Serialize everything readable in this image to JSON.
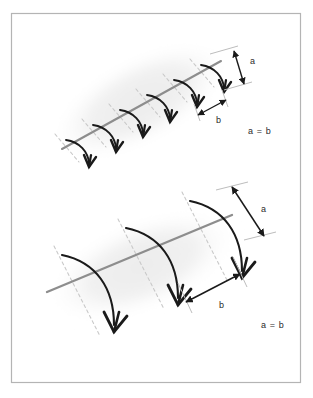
{
  "figure": {
    "background_color": "#ffffff",
    "border_color": "#b4b4b4",
    "frame": {
      "x": 11,
      "y": 13,
      "width": 290,
      "height": 370
    }
  },
  "colors": {
    "axis_line": "#8d8d8d",
    "tick_line": "#c9c9c9",
    "arrow_stroke": "#1a1a1a",
    "dimension_stroke": "#1a1a1a",
    "extension_line": "#bdbdbd",
    "blob_shadow": "#f1f1f1",
    "label_text": "#2b2b2b",
    "paper": "#ffffff"
  },
  "panels": [
    {
      "id": "top-panel",
      "name": "dense-short-arrows-panel",
      "description": "Elongated shaded blob with a gray central axis crossed by six small closely spaced curved arrows",
      "arrow_count": 6,
      "axis": {
        "x1": 62,
        "y1": 149,
        "x2": 221,
        "y2": 61
      },
      "blob": {
        "cx": 140,
        "cy": 101,
        "rx": 104,
        "ry": 47,
        "rotate": -28
      },
      "labels": {
        "a": "a",
        "b": "b",
        "relation": "a = b"
      },
      "label_positions": {
        "a": {
          "x": 247,
          "y": 64
        },
        "b": {
          "x": 219,
          "y": 119
        },
        "relation": {
          "x": 249,
          "y": 133
        }
      },
      "dimension_a": {
        "x1": 222,
        "y1": 52,
        "x2": 238,
        "y2": 81
      },
      "dimension_b": {
        "x1": 198,
        "y1": 113,
        "x2": 228,
        "y2": 97
      }
    },
    {
      "id": "bottom-panel",
      "name": "sparse-long-arrows-panel",
      "description": "Elongated shaded blob with a gray central axis crossed by three large widely spaced curved arrows",
      "arrow_count": 3,
      "axis": {
        "x1": 47,
        "y1": 292,
        "x2": 232,
        "y2": 215
      },
      "blob": {
        "cx": 142,
        "cy": 264,
        "rx": 106,
        "ry": 48,
        "rotate": -22
      },
      "labels": {
        "a": "a",
        "b": "b",
        "relation": "a = b"
      },
      "label_positions": {
        "a": {
          "x": 258,
          "y": 211
        },
        "b": {
          "x": 222,
          "y": 303
        },
        "relation": {
          "x": 262,
          "y": 327
        }
      },
      "dimension_a": {
        "x1": 231,
        "y1": 186,
        "x2": 262,
        "y2": 235
      },
      "dimension_b": {
        "x1": 185,
        "y1": 300,
        "x2": 240,
        "y2": 272
      }
    }
  ],
  "top_arrows": [
    {
      "start": [
        66,
        140
      ],
      "c1": [
        80,
        142
      ],
      "c2": [
        88,
        152
      ],
      "end": [
        89,
        166
      ]
    },
    {
      "start": [
        93,
        125
      ],
      "c1": [
        107,
        127
      ],
      "c2": [
        115,
        137
      ],
      "end": [
        116,
        151
      ]
    },
    {
      "start": [
        120,
        110
      ],
      "c1": [
        134,
        112
      ],
      "c2": [
        142,
        122
      ],
      "end": [
        143,
        136
      ]
    },
    {
      "start": [
        147,
        95
      ],
      "c1": [
        161,
        97
      ],
      "c2": [
        169,
        107
      ],
      "end": [
        170,
        121
      ]
    },
    {
      "start": [
        174,
        80
      ],
      "c1": [
        188,
        82
      ],
      "c2": [
        196,
        92
      ],
      "end": [
        197,
        106
      ]
    },
    {
      "start": [
        201,
        65
      ],
      "c1": [
        215,
        67
      ],
      "c2": [
        223,
        77
      ],
      "end": [
        224,
        91
      ]
    }
  ],
  "top_ticks": [
    {
      "x1": 55,
      "y1": 134,
      "x2": 79,
      "y2": 162
    },
    {
      "x1": 82,
      "y1": 119,
      "x2": 106,
      "y2": 147
    },
    {
      "x1": 109,
      "y1": 104,
      "x2": 133,
      "y2": 132
    },
    {
      "x1": 136,
      "y1": 89,
      "x2": 160,
      "y2": 117
    },
    {
      "x1": 163,
      "y1": 74,
      "x2": 187,
      "y2": 102
    },
    {
      "x1": 190,
      "y1": 59,
      "x2": 214,
      "y2": 87
    }
  ],
  "bottom_arrows": [
    {
      "start": [
        62,
        255
      ],
      "c1": [
        96,
        262
      ],
      "c2": [
        116,
        290
      ],
      "end": [
        115,
        330
      ]
    },
    {
      "start": [
        126,
        228
      ],
      "c1": [
        160,
        235
      ],
      "c2": [
        180,
        263
      ],
      "end": [
        179,
        303
      ]
    },
    {
      "start": [
        190,
        201
      ],
      "c1": [
        224,
        208
      ],
      "c2": [
        244,
        236
      ],
      "end": [
        243,
        276
      ]
    }
  ],
  "bottom_ticks": [
    {
      "x1": 52,
      "y1": 245,
      "x2": 100,
      "y2": 338
    },
    {
      "x1": 116,
      "y1": 218,
      "x2": 164,
      "y2": 311
    },
    {
      "x1": 180,
      "y1": 191,
      "x2": 228,
      "y2": 284
    }
  ]
}
